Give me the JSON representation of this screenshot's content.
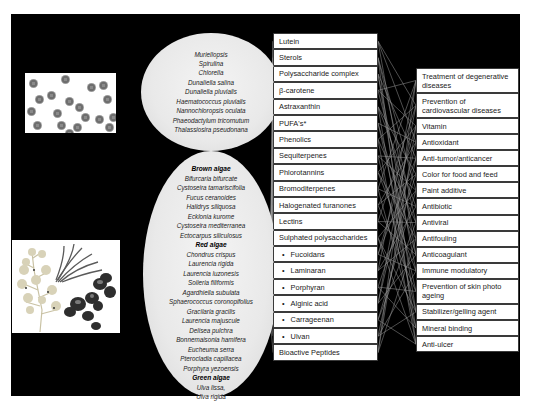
{
  "diagram": {
    "colors": {
      "background": "#000000",
      "ellipse_fill": "#e9e9e9",
      "box_fill": "#ffffff",
      "box_border": "#3a3a3a",
      "connector": "#9a9a9a"
    },
    "microalgae": {
      "image": "microalgae-cells-image",
      "species": [
        "Muriellopsis",
        "Spirulina",
        "Chlorella",
        "Dunaliella salina",
        "Dunaliella pluvialis",
        "Haematococcus pluvialis",
        "Nannochloropsis oculata",
        "Phaeodactylum tricornutum",
        "Thalassiosira pseudonana"
      ]
    },
    "macroalgae": {
      "image": "seaweed-illustration-image",
      "brown_label": "Brown algae",
      "brown": [
        "Bifurcaria bifurcate",
        "Cystoseira tamariscifolia",
        "Fucus ceranoides",
        "Halidrys siliquosa",
        "Ecklonia kurome",
        "Cystoseira mediterranea",
        "Ectocarpus siliculosus"
      ],
      "red_label": "Red algae",
      "red": [
        "Chondrus crispus",
        "Laurencia rigida",
        "Laurencia luzonesis",
        "Solieria filiformis",
        "Agardhiella subulata",
        "Sphaerococcus coronopifolius",
        "Gracilaria gracilis",
        "Laurencia majuscule",
        "Delisea pulchra",
        "Bonnemaisonia hamifera",
        "Eucheuma serra",
        "Pterocladia capillacea",
        "Porphyra yezoensis"
      ],
      "green_label": "Green algae",
      "green": [
        "Ulva lissa,",
        "Ulva rigida"
      ]
    },
    "compounds": [
      {
        "label": "Lutein",
        "bullet": false
      },
      {
        "label": "Sterols",
        "bullet": false
      },
      {
        "label": "Polysaccharide complex",
        "bullet": false
      },
      {
        "label": "β-carotene",
        "bullet": false
      },
      {
        "label": "Astraxanthin",
        "bullet": false
      },
      {
        "label": "PUFA's*",
        "bullet": false
      },
      {
        "label": "Phenolics",
        "bullet": false
      },
      {
        "label": "Sequiterpenes",
        "bullet": false
      },
      {
        "label": "Phlorotannins",
        "bullet": false
      },
      {
        "label": "Bromoditerpenes",
        "bullet": false
      },
      {
        "label": "Halogenated furanones",
        "bullet": false
      },
      {
        "label": "Lectins",
        "bullet": false
      },
      {
        "label": "Sulphated polysaccharides",
        "bullet": false
      },
      {
        "label": "Fucoidans",
        "bullet": true
      },
      {
        "label": "Laminaran",
        "bullet": true
      },
      {
        "label": "Porphyran",
        "bullet": true
      },
      {
        "label": "Alginic acid",
        "bullet": true
      },
      {
        "label": "Carrageenan",
        "bullet": true
      },
      {
        "label": "Ulvan",
        "bullet": true
      },
      {
        "label": "Bioactive Peptides",
        "bullet": false
      }
    ],
    "bullet_char": "•",
    "applications": [
      {
        "label": "Treatment of degenerative diseases",
        "tall": true
      },
      {
        "label": "Prevention of cardiovascular diseases",
        "tall": true
      },
      {
        "label": "Vitamin",
        "tall": false
      },
      {
        "label": "Antioxidant",
        "tall": false
      },
      {
        "label": "Anti-tumor/anticancer",
        "tall": false
      },
      {
        "label": "Color for food and feed",
        "tall": false
      },
      {
        "label": "Paint additive",
        "tall": false
      },
      {
        "label": "Antibiotic",
        "tall": false
      },
      {
        "label": "Antiviral",
        "tall": false
      },
      {
        "label": "Antifouling",
        "tall": false
      },
      {
        "label": "Anticoagulant",
        "tall": false
      },
      {
        "label": "Immune modulatory",
        "tall": false
      },
      {
        "label": "Prevention of skin photo ageing",
        "tall": true
      },
      {
        "label": "Stabilizer/gelling agent",
        "tall": false
      },
      {
        "label": "Mineral binding",
        "tall": false
      },
      {
        "label": "Anti-ulcer",
        "tall": false
      }
    ]
  }
}
